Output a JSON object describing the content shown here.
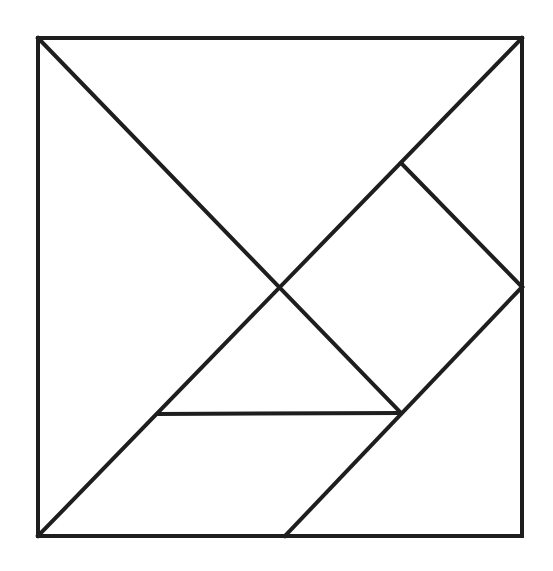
{
  "diagram": {
    "type": "tangram",
    "stroke_color": "#1e1e1e",
    "background": "#ffffff",
    "frame": {
      "x1": 38,
      "y1": 38,
      "x2": 522,
      "y2": 536
    },
    "pieces": [
      {
        "name": "large-triangle-left",
        "points": [
          [
            38,
            38
          ],
          [
            280,
            288
          ],
          [
            38,
            536
          ]
        ]
      },
      {
        "name": "large-triangle-top",
        "points": [
          [
            38,
            38
          ],
          [
            522,
            38
          ],
          [
            280,
            288
          ]
        ]
      },
      {
        "name": "medium-triangle-top-right",
        "points": [
          [
            522,
            38
          ],
          [
            522,
            287
          ],
          [
            401,
            163
          ]
        ]
      },
      {
        "name": "square",
        "points": [
          [
            401,
            163
          ],
          [
            522,
            287
          ],
          [
            401,
            413
          ],
          [
            280,
            288
          ]
        ]
      },
      {
        "name": "small-triangle-middle",
        "points": [
          [
            280,
            288
          ],
          [
            401,
            413
          ],
          [
            158,
            414
          ]
        ]
      },
      {
        "name": "parallelogram-bottom",
        "points": [
          [
            158,
            414
          ],
          [
            401,
            413
          ],
          [
            285,
            536
          ],
          [
            38,
            536
          ]
        ]
      },
      {
        "name": "medium-triangle-bottom-right",
        "points": [
          [
            522,
            287
          ],
          [
            522,
            536
          ],
          [
            285,
            536
          ]
        ]
      }
    ],
    "lines": [
      {
        "name": "diagonal-main-descending",
        "x1": 38,
        "y1": 38,
        "x2": 401,
        "y2": 413
      },
      {
        "name": "diagonal-main-ascending",
        "x1": 38,
        "y1": 536,
        "x2": 522,
        "y2": 38
      },
      {
        "name": "square-top-right-edge",
        "x1": 401,
        "y1": 163,
        "x2": 522,
        "y2": 287
      },
      {
        "name": "square-bottom-right-edge",
        "x1": 522,
        "y1": 287,
        "x2": 285,
        "y2": 536
      },
      {
        "name": "horizontal-divider",
        "x1": 158,
        "y1": 414,
        "x2": 401,
        "y2": 413
      }
    ]
  }
}
